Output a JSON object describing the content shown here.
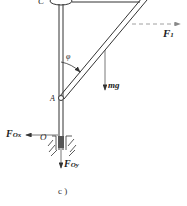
{
  "diagram": {
    "caption": "c )",
    "points": {
      "C": "C",
      "A": "A",
      "O": "O"
    },
    "angle": "φ",
    "forces": {
      "F1": {
        "main": "F",
        "sub": "1"
      },
      "mg": "mg",
      "FOx": {
        "main": "F",
        "sub": "Ox"
      },
      "FOy": {
        "main": "F",
        "sub": "Oy"
      }
    },
    "colors": {
      "line": "#333333",
      "dashed": "#888888"
    }
  }
}
